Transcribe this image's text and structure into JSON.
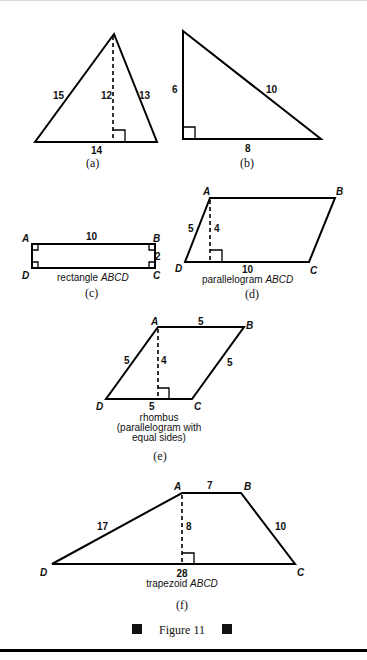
{
  "figure_caption": "Figure 11",
  "figures": {
    "a": {
      "sub_label": "(a)",
      "side_left": "15",
      "side_right": "13",
      "height": "12",
      "base": "14"
    },
    "b": {
      "sub_label": "(b)",
      "leg_vertical": "6",
      "hypotenuse": "10",
      "leg_horizontal": "8"
    },
    "c": {
      "sub_label": "(c)",
      "vertices": {
        "A": "A",
        "B": "B",
        "C": "C",
        "D": "D"
      },
      "length": "10",
      "width": "2",
      "caption_prefix": "rectangle ",
      "caption_name": "ABCD"
    },
    "d": {
      "sub_label": "(d)",
      "vertices": {
        "A": "A",
        "B": "B",
        "C": "C",
        "D": "D"
      },
      "side": "5",
      "height": "4",
      "base": "10",
      "caption_prefix": "parallelogram ",
      "caption_name": "ABCD"
    },
    "e": {
      "sub_label": "(e)",
      "vertices": {
        "A": "A",
        "B": "B",
        "C": "C",
        "D": "D"
      },
      "side_top": "5",
      "side_left": "5",
      "side_right": "5",
      "base": "5",
      "height": "4",
      "caption_line1": "rhombus",
      "caption_line2": "(parallelogram with",
      "caption_line3": "equal sides)"
    },
    "f": {
      "sub_label": "(f)",
      "vertices": {
        "A": "A",
        "B": "B",
        "C": "C",
        "D": "D"
      },
      "top": "7",
      "side_left": "17",
      "side_right": "10",
      "height": "8",
      "base": "28",
      "caption_prefix": "trapezoid ",
      "caption_name": "ABCD"
    }
  },
  "icons": {
    "caption_bullet_left": "black-square-icon",
    "caption_bullet_right": "black-square-icon"
  }
}
